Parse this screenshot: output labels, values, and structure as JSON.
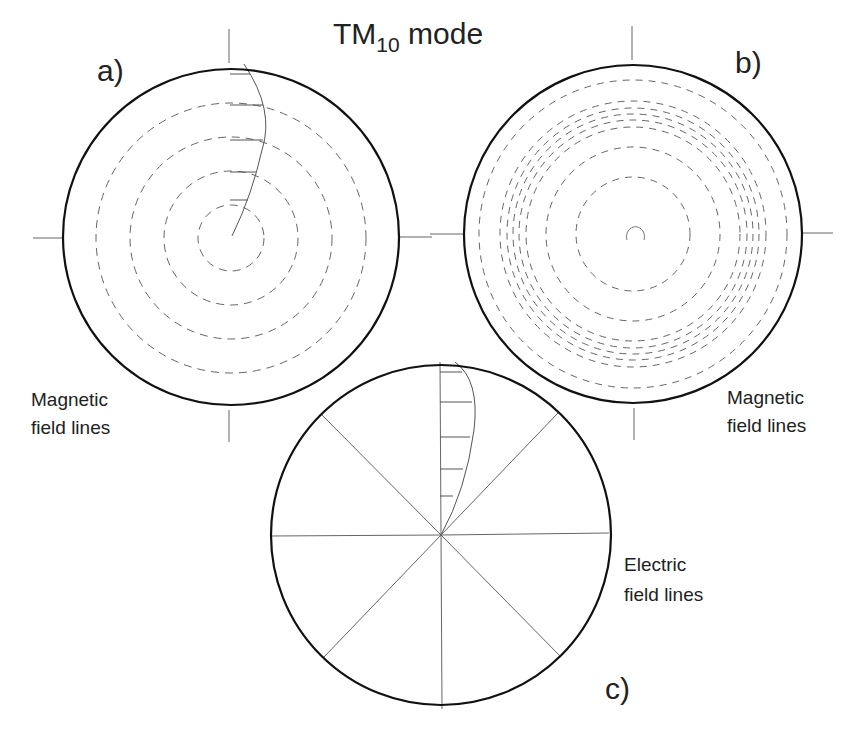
{
  "title": {
    "main": "TM",
    "subscript": "10",
    "suffix": " mode"
  },
  "panels": {
    "a": {
      "letter": "a)",
      "caption_line1": "Magnetic",
      "caption_line2": "field lines"
    },
    "b": {
      "letter": "b)",
      "caption_line1": "Magnetic",
      "caption_line2": "field lines"
    },
    "c": {
      "letter": "c)",
      "caption_line1": "Electric",
      "caption_line2": "field lines"
    }
  },
  "colors": {
    "outline": "#111111",
    "line": "#555555",
    "dash": "#666666",
    "background": "#ffffff"
  }
}
